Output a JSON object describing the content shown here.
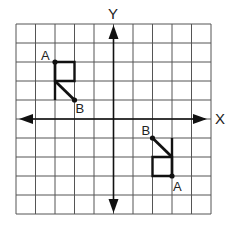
{
  "diagram": {
    "type": "coordinate-grid-transformation",
    "grid": {
      "cols": 10,
      "rows": 10,
      "x_range": [
        -5,
        5
      ],
      "y_range": [
        -5,
        5
      ]
    },
    "axes": {
      "x_label": "X",
      "y_label": "Y"
    },
    "colors": {
      "grid": "#555555",
      "axis": "#111111",
      "shape": "#111111",
      "background": "#ffffff"
    },
    "figures": [
      {
        "name": "original",
        "point_A": {
          "label": "A",
          "x": -3,
          "y": 3
        },
        "point_B": {
          "label": "B",
          "x": -2,
          "y": 1
        },
        "square": [
          [
            -3,
            3
          ],
          [
            -2,
            3
          ],
          [
            -2,
            2
          ],
          [
            -3,
            2
          ]
        ],
        "stem": [
          [
            -3,
            3
          ],
          [
            -3,
            1
          ]
        ],
        "diagonal": [
          [
            -3,
            2
          ],
          [
            -2,
            1
          ]
        ]
      },
      {
        "name": "image",
        "point_A": {
          "label": "A",
          "x": 3,
          "y": -3
        },
        "point_B": {
          "label": "B",
          "x": 2,
          "y": -1
        },
        "square": [
          [
            2,
            -2
          ],
          [
            3,
            -2
          ],
          [
            3,
            -3
          ],
          [
            2,
            -3
          ]
        ],
        "stem": [
          [
            3,
            -1
          ],
          [
            3,
            -3
          ]
        ],
        "diagonal": [
          [
            3,
            -2
          ],
          [
            2,
            -1
          ]
        ]
      }
    ]
  }
}
